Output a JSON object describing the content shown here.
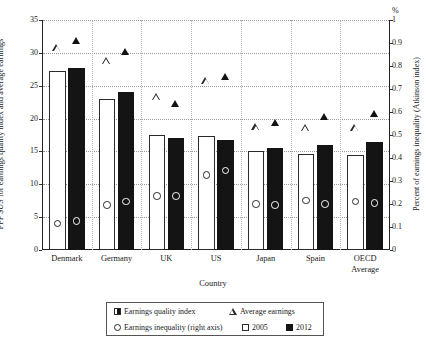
{
  "chart_data": {
    "type": "bar",
    "title": "",
    "categories": [
      "Denmark",
      "Germany",
      "UK",
      "US",
      "Japan",
      "Spain",
      "OECD Average"
    ],
    "xlabel": "Country",
    "ylabel_left": "PPP $US for earnings quality index and average earnings",
    "ylabel_right": "Percent of earnings inequality (Atkinson index)",
    "right_axis_unit": "%",
    "ylim_left": [
      0,
      35
    ],
    "ylim_right": [
      0,
      1
    ],
    "yticks_left": [
      "0",
      "5",
      "10",
      "15",
      "20",
      "25",
      "30",
      "35"
    ],
    "yticks_right": [
      "0",
      "0.1",
      "0.2",
      "0.3",
      "0.4",
      "0.5",
      "0.6",
      "0.7",
      "0.8",
      "0.9",
      "1"
    ],
    "grid": true,
    "legend_position": "bottom",
    "series": [
      {
        "name": "Earnings quality index",
        "symbol": "bar",
        "axis": "left",
        "years": [
          {
            "year": "2005",
            "fill": "white",
            "values": [
              27.2,
              23.0,
              17.5,
              17.4,
              15.0,
              14.6,
              14.5
            ]
          },
          {
            "year": "2012",
            "fill": "black",
            "values": [
              27.7,
              24.0,
              17.0,
              16.8,
              15.5,
              16.0,
              16.5
            ]
          }
        ]
      },
      {
        "name": "Average earnings",
        "symbol": "triangle",
        "axis": "left",
        "years": [
          {
            "year": "2005",
            "fill": "white",
            "values": [
              30.8,
              28.8,
              23.3,
              25.8,
              18.7,
              18.6,
              18.6
            ]
          },
          {
            "year": "2012",
            "fill": "black",
            "values": [
              31.8,
              30.2,
              22.3,
              26.3,
              19.3,
              20.3,
              20.8
            ]
          }
        ]
      },
      {
        "name": "Earnings inequality (right axis)",
        "symbol": "circle",
        "axis": "right",
        "years": [
          {
            "year": "2005",
            "fill": "white",
            "values": [
              0.115,
              0.195,
              0.235,
              0.325,
              0.2,
              0.215,
              0.21
            ]
          },
          {
            "year": "2012",
            "fill": "black",
            "values": [
              0.125,
              0.21,
              0.235,
              0.345,
              0.195,
              0.2,
              0.205
            ]
          }
        ]
      }
    ],
    "legend": {
      "entries": [
        {
          "label": "Earnings quality index",
          "symbol": "half-square"
        },
        {
          "label": "Average earnings",
          "symbol": "open-triangle"
        },
        {
          "label": "Earnings inequality (right axis)",
          "symbol": "open-circle"
        },
        {
          "label": "2005",
          "symbol": "white-square"
        },
        {
          "label": "2012",
          "symbol": "black-square"
        }
      ]
    },
    "colors": {
      "bar_2005": "#ffffff",
      "bar_2012": "#141414",
      "outline": "#2b2b2b",
      "grid": "#9a9a9a",
      "axis": "#222222"
    }
  }
}
